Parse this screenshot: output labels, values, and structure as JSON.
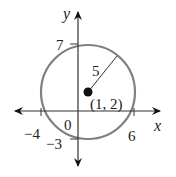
{
  "diagram": {
    "axes": {
      "x_label": "x",
      "y_label": "y",
      "origin_label": "0"
    },
    "ticks": {
      "x_neg": "−4",
      "x_pos": "6",
      "y_pos": "7",
      "y_neg": "−3"
    },
    "circle": {
      "center_label": "(1, 2)",
      "radius_label": "5",
      "center": [
        1,
        2
      ],
      "radius": 5
    },
    "colors": {
      "circle": "#808080",
      "axes": "#222222",
      "point": "#111111"
    }
  }
}
